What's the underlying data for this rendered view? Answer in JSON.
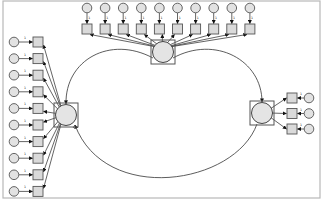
{
  "diagram": {
    "type": "structural-equation-model",
    "background": "#ffffff",
    "frame_color": "#b8b8b8",
    "node_fill": "#dadada",
    "stroke_color": "#444444",
    "latents": [
      {
        "id": "top",
        "label": "",
        "cx": 163,
        "cy": 52,
        "indicator_count": 10
      },
      {
        "id": "left",
        "label": "",
        "cx": 66,
        "cy": 115,
        "indicator_count": 10
      },
      {
        "id": "right",
        "label": "",
        "cx": 262,
        "cy": 113,
        "indicator_count": 3
      }
    ],
    "fixed_loading_label": "1",
    "covariances": [
      {
        "from": "top",
        "to": "left"
      },
      {
        "from": "top",
        "to": "right"
      },
      {
        "from": "left",
        "to": "right"
      }
    ]
  }
}
